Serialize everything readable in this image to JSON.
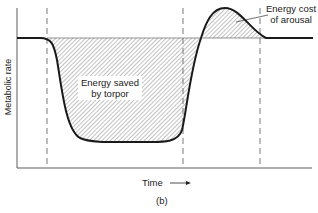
{
  "figure": {
    "panel_label": "(b)",
    "y_axis_label": "Metabolic rate",
    "x_axis_label": "Time",
    "x_axis_arrow": "→",
    "annotations": {
      "energy_saved": {
        "line1": "Energy saved",
        "line2": "by torpor"
      },
      "energy_cost": {
        "line1": "Energy cost",
        "line2": "of arousal"
      }
    },
    "colors": {
      "line": "#1a1a1a",
      "dash": "#555555",
      "hatch": "#777777"
    }
  }
}
